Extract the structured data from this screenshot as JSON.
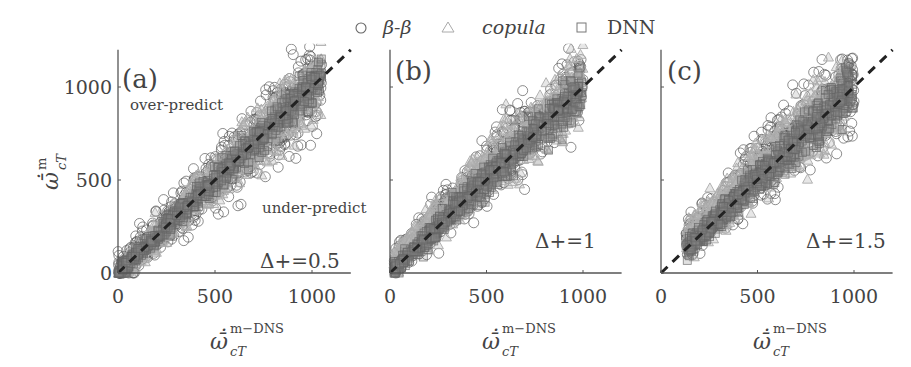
{
  "legend": {
    "items": [
      {
        "marker": "circle",
        "label": "β-β",
        "color": "#555555"
      },
      {
        "marker": "triangle",
        "label": "copula",
        "color": "#aaaaaa"
      },
      {
        "marker": "square",
        "label": "DNN",
        "color": "#777777"
      }
    ]
  },
  "chart_data": [
    {
      "type": "scatter",
      "panel": "(a)",
      "annotation": "Δ+=0.5",
      "region_labels": [
        "over-predict",
        "under-predict"
      ],
      "xlabel": "ω̄̇_cT^{m−DNS}",
      "ylabel": "ω̄̇_cT^{m}",
      "xticks": [
        0,
        500,
        1000
      ],
      "yticks": [
        0,
        500,
        1000
      ],
      "xlim": [
        0,
        1200
      ],
      "ylim": [
        0,
        1200
      ],
      "reference_line": {
        "style": "dashed",
        "slope": 1,
        "intercept": 0
      },
      "series": [
        {
          "name": "β-β",
          "marker": "circle",
          "spread": 120,
          "x_range": [
            0,
            1050
          ]
        },
        {
          "name": "copula",
          "marker": "triangle",
          "spread": 90,
          "x_range": [
            0,
            1050
          ]
        },
        {
          "name": "DNN",
          "marker": "square",
          "spread": 50,
          "x_range": [
            0,
            1050
          ]
        }
      ]
    },
    {
      "type": "scatter",
      "panel": "(b)",
      "annotation": "Δ+=1",
      "xlabel": "ω̄̇_cT^{m−DNS}",
      "ylabel": "",
      "xticks": [
        0,
        500,
        1000
      ],
      "yticks": [
        0,
        500,
        1000
      ],
      "ytick_labels_shown": false,
      "xlim": [
        0,
        1200
      ],
      "ylim": [
        0,
        1200
      ],
      "reference_line": {
        "style": "dashed",
        "slope": 1,
        "intercept": 0
      },
      "series": [
        {
          "name": "β-β",
          "marker": "circle",
          "spread": 110,
          "x_range": [
            20,
            1000
          ]
        },
        {
          "name": "copula",
          "marker": "triangle",
          "spread": 100,
          "x_range": [
            20,
            1000
          ]
        },
        {
          "name": "DNN",
          "marker": "square",
          "spread": 60,
          "x_range": [
            20,
            1000
          ]
        }
      ]
    },
    {
      "type": "scatter",
      "panel": "(c)",
      "annotation": "Δ+=1.5",
      "xlabel": "ω̄̇_cT^{m−DNS}",
      "ylabel": "",
      "xticks": [
        0,
        500,
        1000
      ],
      "yticks": [
        0,
        500,
        1000
      ],
      "ytick_labels_shown": false,
      "xlim": [
        0,
        1200
      ],
      "ylim": [
        0,
        1200
      ],
      "reference_line": {
        "style": "dashed",
        "slope": 1,
        "intercept": 0
      },
      "series": [
        {
          "name": "β-β",
          "marker": "circle",
          "spread": 120,
          "x_range": [
            130,
            1000
          ]
        },
        {
          "name": "copula",
          "marker": "triangle",
          "spread": 110,
          "x_range": [
            130,
            950
          ]
        },
        {
          "name": "DNN",
          "marker": "square",
          "spread": 60,
          "x_range": [
            130,
            1000
          ]
        }
      ]
    }
  ],
  "axis_text": {
    "x_main": "ω̄̇",
    "x_sub": "cT",
    "x_sup": "m−DNS",
    "y_main": "ω̄̇",
    "y_sub": "cT",
    "y_sup": "m"
  }
}
